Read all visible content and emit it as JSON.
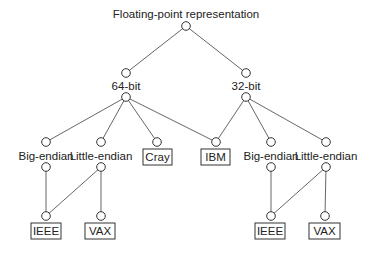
{
  "diagram": {
    "title": "Floating-point representation",
    "nodes": {
      "root": {
        "label": "Floating-point representation",
        "x": 186,
        "y": 26
      },
      "b64_top": {
        "x": 126,
        "y": 73
      },
      "b64": {
        "label": "64-bit",
        "x": 126,
        "y": 97
      },
      "b32_top": {
        "x": 246,
        "y": 73
      },
      "b32": {
        "label": "32-bit",
        "x": 246,
        "y": 97
      },
      "l_big_top": {
        "x": 46,
        "y": 142
      },
      "l_big": {
        "label": "Big-endian",
        "x": 46,
        "y": 167
      },
      "l_little_top": {
        "x": 101,
        "y": 142
      },
      "l_little": {
        "label": "Little-endian",
        "x": 101,
        "y": 167
      },
      "cray": {
        "label": "Cray",
        "x": 157,
        "y": 142
      },
      "ibm": {
        "label": "IBM",
        "x": 216,
        "y": 142
      },
      "r_big_top": {
        "x": 271,
        "y": 142
      },
      "r_big": {
        "label": "Big-endian",
        "x": 271,
        "y": 167
      },
      "r_little_top": {
        "x": 326,
        "y": 142
      },
      "r_little": {
        "label": "Little-endian",
        "x": 326,
        "y": 167
      },
      "l_ieee": {
        "label": "IEEE",
        "x": 46,
        "y": 216
      },
      "l_vax": {
        "label": "VAX",
        "x": 101,
        "y": 216
      },
      "r_ieee": {
        "label": "IEEE",
        "x": 271,
        "y": 216
      },
      "r_vax": {
        "label": "VAX",
        "x": 325,
        "y": 216
      }
    },
    "labels": {
      "root": "Floating-point representation",
      "b64": "64-bit",
      "b32": "32-bit",
      "l_big": "Big-endian",
      "l_little": "Little-endian",
      "cray": "Cray",
      "ibm": "IBM",
      "r_big": "Big-endian",
      "r_little": "Little-endian",
      "l_ieee": "IEEE",
      "l_vax": "VAX",
      "r_ieee": "IEEE",
      "r_vax": "VAX"
    },
    "edges": [
      [
        "Floating-point representation",
        "64-bit"
      ],
      [
        "Floating-point representation",
        "32-bit"
      ],
      [
        "64-bit",
        "Big-endian"
      ],
      [
        "64-bit",
        "Little-endian"
      ],
      [
        "64-bit",
        "Cray"
      ],
      [
        "64-bit",
        "IBM"
      ],
      [
        "32-bit",
        "IBM"
      ],
      [
        "32-bit",
        "Big-endian"
      ],
      [
        "32-bit",
        "Little-endian"
      ],
      [
        "Big-endian (64)",
        "IEEE"
      ],
      [
        "Little-endian (64)",
        "IEEE"
      ],
      [
        "Little-endian (64)",
        "VAX"
      ],
      [
        "Big-endian (32)",
        "IEEE"
      ],
      [
        "Little-endian (32)",
        "IEEE"
      ],
      [
        "Little-endian (32)",
        "VAX"
      ]
    ],
    "leaf_boxes": [
      "Cray",
      "IBM",
      "IEEE",
      "VAX",
      "IEEE",
      "VAX"
    ]
  }
}
